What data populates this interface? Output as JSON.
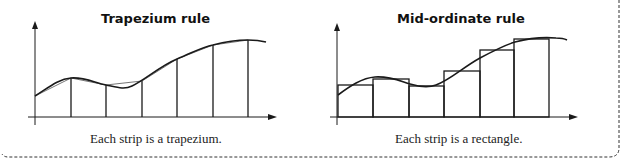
{
  "panels": [
    {
      "title": "Trapezium rule",
      "caption": "Each strip is a trapezium.",
      "method": "trapezium"
    },
    {
      "title": "Mid-ordinate rule",
      "caption": "Each strip is a rectangle.",
      "method": "mid-ordinate"
    }
  ],
  "colors": {
    "line": "#1a1a1a",
    "border": "#333333",
    "background": "#ffffff"
  }
}
